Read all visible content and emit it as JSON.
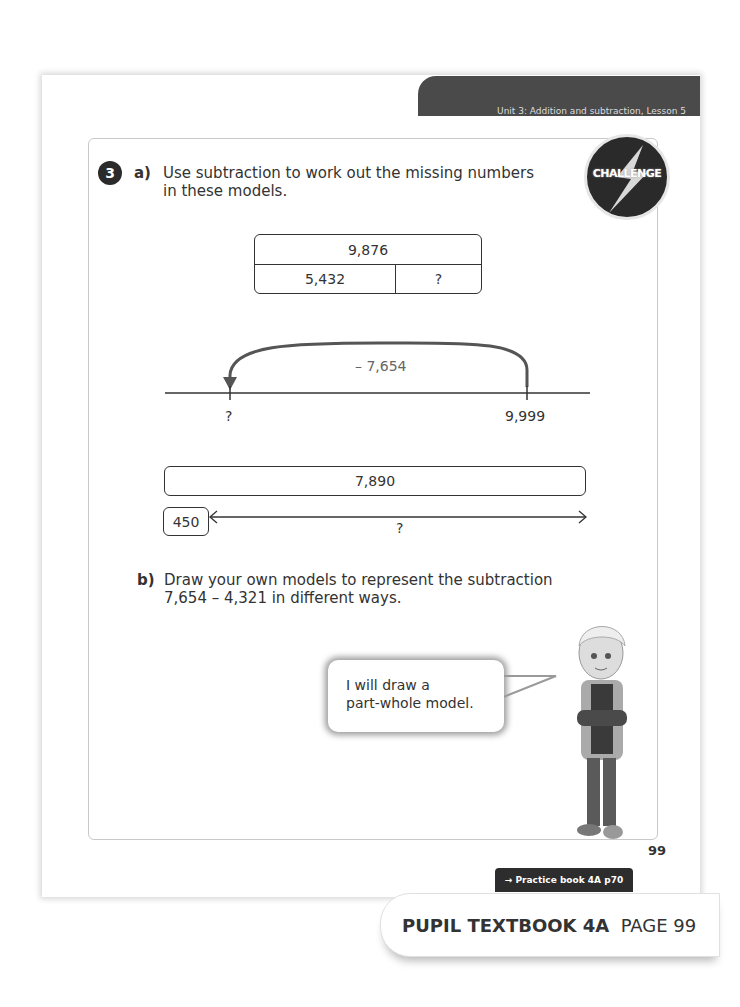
{
  "header": {
    "unit_banner": "Unit 3: Addition and subtraction, Lesson 5",
    "badge": "CHALLENGE"
  },
  "question": {
    "number": "3",
    "part_a": {
      "label": "a)",
      "line1": "Use subtraction to work out the missing numbers",
      "line2": "in these models."
    },
    "bar_model": {
      "whole": "9,876",
      "part1": "5,432",
      "part2": "?"
    },
    "number_line": {
      "jump_label": "– 7,654",
      "start_label": "?",
      "end_label": "9,999"
    },
    "bar_model_2": {
      "whole": "7,890",
      "part": "450",
      "unknown": "?"
    },
    "part_b": {
      "label": "b)",
      "line1": "Draw your own models to represent the subtraction",
      "line2": "7,654 – 4,321 in different ways."
    }
  },
  "speech_bubble": {
    "line1": "I will draw a",
    "line2": "part-whole model."
  },
  "footer": {
    "page_number": "99",
    "practice_link": "→ Practice book 4A p70",
    "textbook_label": "PUPIL TEXTBOOK 4A",
    "page_label": "PAGE 99"
  }
}
